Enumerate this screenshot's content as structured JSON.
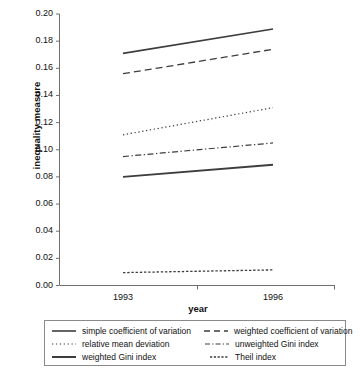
{
  "chart_data": {
    "type": "line",
    "title": "",
    "xlabel": "year",
    "ylabel": "inequality measure",
    "x": [
      "1993",
      "1996"
    ],
    "categories": [
      "1993",
      "1996"
    ],
    "xtick_labels": [
      "1993",
      "1996"
    ],
    "ytick_labels": [
      "0.20",
      "0.18",
      "0.16",
      "0.14",
      "0.12",
      "0.10",
      "0.08",
      "0.06",
      "0.04",
      "0.02",
      "0.00"
    ],
    "ytick_values": [
      0.2,
      0.18,
      0.16,
      0.14,
      0.12,
      0.1,
      0.08,
      0.06,
      0.04,
      0.02,
      0.0
    ],
    "ylim": [
      0.0,
      0.2
    ],
    "grid": false,
    "legend_position": "below-axes-boxed",
    "series": [
      {
        "name": "simple coefficient of variation",
        "style": "solid",
        "linewidth": 1.6,
        "color": "#3d3d3d",
        "values": [
          0.171,
          0.189
        ]
      },
      {
        "name": "weighted coefficient of variation",
        "style": "dashed",
        "linewidth": 1.3,
        "color": "#3d3d3d",
        "values": [
          0.156,
          0.174
        ]
      },
      {
        "name": "relative mean deviation",
        "style": "dotted",
        "linewidth": 1.2,
        "color": "#3d3d3d",
        "values": [
          0.111,
          0.131
        ]
      },
      {
        "name": "unweighted Gini index",
        "style": "dashdot",
        "linewidth": 1.2,
        "color": "#3d3d3d",
        "values": [
          0.095,
          0.105
        ]
      },
      {
        "name": "weighted Gini index",
        "style": "solid",
        "linewidth": 1.9,
        "color": "#3d3d3d",
        "values": [
          0.08,
          0.089
        ]
      },
      {
        "name": "Theil index",
        "style": "finedash",
        "linewidth": 1.3,
        "color": "#3d3d3d",
        "values": [
          0.0095,
          0.0115
        ]
      }
    ]
  },
  "axes": {
    "y_title": "inequality measure",
    "x_title": "year",
    "y_labels": [
      "0.20",
      "0.18",
      "0.16",
      "0.14",
      "0.12",
      "0.10",
      "0.08",
      "0.06",
      "0.04",
      "0.02",
      "0.00"
    ],
    "x_labels": [
      "1993",
      "1996"
    ]
  },
  "legend": {
    "entries": [
      {
        "label": "simple coefficient of variation",
        "style": "solid"
      },
      {
        "label": "weighted coefficient of variation",
        "style": "dashed"
      },
      {
        "label": "relative mean deviation",
        "style": "dotted"
      },
      {
        "label": "unweighted Gini index",
        "style": "dashdot"
      },
      {
        "label": "weighted Gini index",
        "style": "solid-thick"
      },
      {
        "label": "Theil index",
        "style": "finedash"
      }
    ]
  },
  "colors": {
    "line": "#3d3d3d",
    "axis": "#6f6f6f",
    "text": "#111111",
    "legend_border": "#8a8a8a",
    "background": "#ffffff"
  }
}
